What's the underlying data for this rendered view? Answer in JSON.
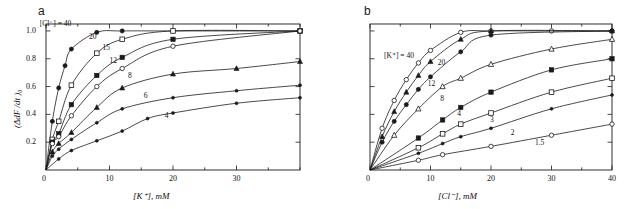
{
  "figure": {
    "panels": [
      {
        "letter": "a",
        "xlabel": "[K⁺], mM",
        "ylabel": "(ΔdF /dt )₀",
        "legend_prefix": "[Cl⁻] = 40",
        "xticks": [
          "0",
          "10",
          "20",
          "30"
        ],
        "yticks": [
          "1.0",
          "0.8",
          "0.6",
          "0.4",
          "0.2"
        ],
        "curve_labels": [
          "40",
          "20",
          "15",
          "12",
          "8",
          "6",
          "4"
        ]
      },
      {
        "letter": "b",
        "xlabel": "[Cl⁻], mM",
        "ylabel": "",
        "legend_prefix": "[K⁺] = 40",
        "xticks": [
          "0",
          "10",
          "20",
          "30",
          "40"
        ],
        "yticks": [
          "",
          "",
          "",
          "",
          ""
        ],
        "curve_labels": [
          "40",
          "20",
          "12",
          "8",
          "4",
          "3",
          "2",
          "1.5"
        ]
      }
    ]
  },
  "chart_data": [
    {
      "type": "line",
      "panel": "a",
      "title": "",
      "xlabel": "[K+], mM",
      "ylabel": "(ΔdF/dt)0",
      "xlim": [
        0,
        40
      ],
      "ylim": [
        0,
        1.05
      ],
      "xticks": [
        0,
        10,
        20,
        30
      ],
      "yticks": [
        0.2,
        0.4,
        0.6,
        0.8,
        1.0
      ],
      "grid": false,
      "legend": "[Cl-] = value in mM, curve labels placed on curves",
      "series": [
        {
          "name": "40",
          "marker": "filled-circle",
          "x": [
            1,
            2,
            3,
            4,
            8,
            12,
            20,
            40
          ],
          "y": [
            0.35,
            0.59,
            0.75,
            0.87,
            0.99,
            1.0,
            1.0,
            1.0
          ]
        },
        {
          "name": "20",
          "marker": "open-square",
          "x": [
            1,
            2,
            4,
            8,
            12,
            20,
            40
          ],
          "y": [
            0.22,
            0.35,
            0.61,
            0.84,
            0.94,
            1.0,
            1.0
          ]
        },
        {
          "name": "15",
          "marker": "filled-square",
          "x": [
            1,
            2,
            4,
            8,
            12,
            20,
            40
          ],
          "y": [
            0.2,
            0.26,
            0.47,
            0.68,
            0.81,
            0.94,
            1.0
          ]
        },
        {
          "name": "12",
          "marker": "open-circle",
          "x": [
            1,
            2,
            4,
            8,
            12,
            20,
            40
          ],
          "y": [
            0.19,
            0.24,
            0.39,
            0.6,
            0.73,
            0.89,
            1.0
          ]
        },
        {
          "name": "8",
          "marker": "filled-triangle",
          "x": [
            1,
            2,
            4,
            8,
            12,
            20,
            30,
            40
          ],
          "y": [
            0.13,
            0.19,
            0.27,
            0.45,
            0.59,
            0.69,
            0.73,
            0.78
          ]
        },
        {
          "name": "6",
          "marker": "small-filled-circle",
          "x": [
            1,
            2,
            4,
            8,
            12,
            20,
            30,
            40
          ],
          "y": [
            0.1,
            0.15,
            0.22,
            0.34,
            0.44,
            0.52,
            0.57,
            0.61
          ]
        },
        {
          "name": "4",
          "marker": "small-filled-circle",
          "x": [
            2,
            4,
            8,
            12,
            16,
            20,
            30,
            40
          ],
          "y": [
            0.08,
            0.14,
            0.21,
            0.28,
            0.37,
            0.41,
            0.48,
            0.52
          ]
        }
      ]
    },
    {
      "type": "line",
      "panel": "b",
      "title": "",
      "xlabel": "[Cl-], mM",
      "ylabel": "(ΔdF/dt)0",
      "xlim": [
        0,
        40
      ],
      "ylim": [
        0,
        1.05
      ],
      "xticks": [
        0,
        10,
        20,
        30,
        40
      ],
      "yticks": [
        0.2,
        0.4,
        0.6,
        0.8,
        1.0
      ],
      "grid": false,
      "legend": "[K+] = value in mM, curve labels placed on curves",
      "series": [
        {
          "name": "40",
          "marker": "open-circle",
          "x": [
            2,
            4,
            6,
            8,
            10,
            15,
            20,
            30,
            40
          ],
          "y": [
            0.3,
            0.5,
            0.65,
            0.77,
            0.86,
            0.99,
            1.0,
            1.0,
            1.0
          ]
        },
        {
          "name": "20",
          "marker": "filled-triangle",
          "x": [
            2,
            4,
            6,
            8,
            10,
            15,
            20,
            40
          ],
          "y": [
            0.24,
            0.42,
            0.56,
            0.68,
            0.78,
            0.94,
            1.0,
            1.0
          ]
        },
        {
          "name": "12",
          "marker": "filled-circle",
          "x": [
            2,
            4,
            6,
            8,
            10,
            15,
            20,
            40
          ],
          "y": [
            0.2,
            0.35,
            0.47,
            0.58,
            0.67,
            0.85,
            0.97,
            1.0
          ]
        },
        {
          "name": "8",
          "marker": "open-triangle",
          "x": [
            4,
            8,
            12,
            15,
            20,
            30,
            40
          ],
          "y": [
            0.25,
            0.44,
            0.6,
            0.66,
            0.76,
            0.87,
            0.94
          ]
        },
        {
          "name": "4",
          "marker": "filled-square",
          "x": [
            8,
            12,
            15,
            20,
            30,
            40
          ],
          "y": [
            0.23,
            0.36,
            0.45,
            0.56,
            0.72,
            0.8
          ]
        },
        {
          "name": "3",
          "marker": "open-square",
          "x": [
            8,
            12,
            15,
            20,
            30,
            40
          ],
          "y": [
            0.16,
            0.26,
            0.33,
            0.41,
            0.56,
            0.66
          ]
        },
        {
          "name": "2",
          "marker": "small-filled-circle",
          "x": [
            8,
            12,
            15,
            20,
            30,
            40
          ],
          "y": [
            0.12,
            0.19,
            0.24,
            0.3,
            0.44,
            0.54
          ]
        },
        {
          "name": "1.5",
          "marker": "open-circle",
          "x": [
            8,
            12,
            20,
            30,
            40
          ],
          "y": [
            0.07,
            0.11,
            0.17,
            0.25,
            0.33
          ]
        }
      ]
    }
  ]
}
